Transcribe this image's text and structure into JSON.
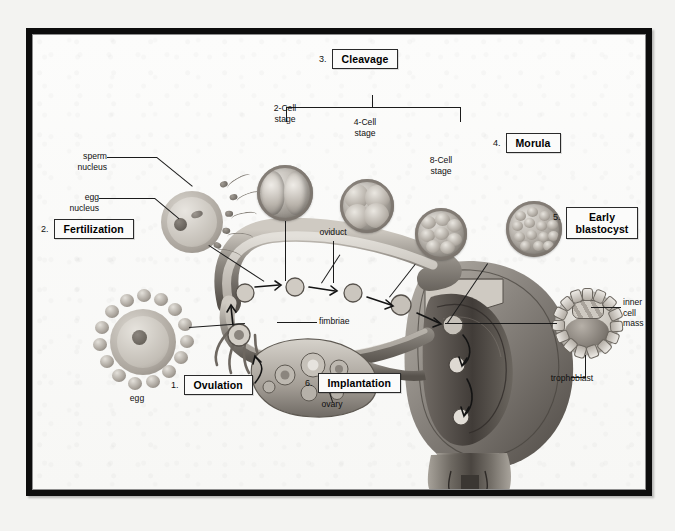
{
  "figure": {
    "kind": "labeled biological diagram",
    "background_color": "#fbfbfa",
    "frame_color": "#0d0d0d",
    "text_color": "#101010"
  },
  "numbered_steps": [
    {
      "number": "1.",
      "label": "Ovulation"
    },
    {
      "number": "2.",
      "label": "Fertilization"
    },
    {
      "number": "3.",
      "label": "Cleavage"
    },
    {
      "number": "4.",
      "label": "Morula"
    },
    {
      "number": "5.",
      "label": "Early\nblastocyst"
    },
    {
      "number": "6.",
      "label": "Implantation"
    }
  ],
  "stage_labels": [
    {
      "name": "two-cell",
      "text": "2-Cell\nstage"
    },
    {
      "name": "four-cell",
      "text": "4-Cell\nstage"
    },
    {
      "name": "eight-cell",
      "text": "8-Cell\nstage"
    }
  ],
  "anatomy_labels": [
    {
      "name": "sperm-nucleus",
      "text": "sperm\nnucleus"
    },
    {
      "name": "egg-nucleus",
      "text": "egg\nnucleus"
    },
    {
      "name": "oviduct",
      "text": "oviduct"
    },
    {
      "name": "fimbriae",
      "text": "fimbriae"
    },
    {
      "name": "ovary",
      "text": "ovary"
    },
    {
      "name": "egg",
      "text": "egg"
    },
    {
      "name": "inner-cell-mass",
      "text": "inner\ncell\nmass"
    },
    {
      "name": "trophoblast",
      "text": "trophoblast"
    }
  ]
}
